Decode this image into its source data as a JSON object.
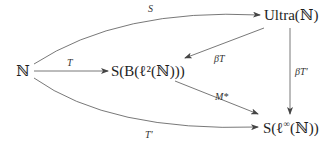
{
  "diagram": {
    "type": "commutative-diagram",
    "nodes": [
      {
        "id": "N",
        "label": "ℕ"
      },
      {
        "id": "SB",
        "label": "S(B(ℓ²(ℕ)))"
      },
      {
        "id": "Ultra",
        "label": "Ultra(ℕ)"
      },
      {
        "id": "Sinf",
        "label": "S(ℓ^∞(ℕ))",
        "display": "S(ℓ∞(ℕ))"
      }
    ],
    "edges": [
      {
        "from": "N",
        "to": "Ultra",
        "label": "S",
        "shape": "curved-up"
      },
      {
        "from": "N",
        "to": "SB",
        "label": "T",
        "shape": "straight"
      },
      {
        "from": "Ultra",
        "to": "SB",
        "label": "βT",
        "shape": "straight"
      },
      {
        "from": "Ultra",
        "to": "Sinf",
        "label": "βT′",
        "shape": "vertical"
      },
      {
        "from": "SB",
        "to": "Sinf",
        "label": "M*",
        "shape": "straight"
      },
      {
        "from": "N",
        "to": "Sinf",
        "label": "T′",
        "shape": "curved-down"
      }
    ]
  },
  "labels": {
    "N": "ℕ",
    "SB": "S(B(ℓ²(ℕ)))",
    "Ultra": "Ultra(ℕ)",
    "Sinf_pre": "S(ℓ",
    "Sinf_sup": "∞",
    "Sinf_post": "(ℕ))",
    "edge_S": "S",
    "edge_T": "T",
    "edge_betaT": "βT",
    "edge_betaTprime": "βT′",
    "edge_Mstar": "M*",
    "edge_Tprime": "T′"
  }
}
